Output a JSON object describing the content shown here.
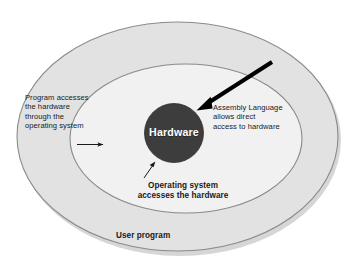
{
  "diagram": {
    "type": "concentric-ellipse-layer-diagram",
    "layers": [
      {
        "id": "outer",
        "name": "user-program-layer",
        "label": "User program",
        "fill": "#e2e2e2",
        "stroke": "#8a8a8a"
      },
      {
        "id": "middle",
        "name": "operating-system-layer",
        "label": "",
        "fill": "#f1f1f1",
        "stroke": "#8a8a8a"
      },
      {
        "id": "core",
        "name": "hardware-core",
        "label": "Hardware",
        "fill": "#3d3d3d",
        "stroke": "#2a2a2a"
      }
    ],
    "annotations": {
      "left": "Program accesses\nthe hardware\nthrough the\noperating system",
      "right": "Assembly Language\nallows direct\naccess to hardware",
      "bottom": "Operating system\naccesses the hardware",
      "outer": "User program",
      "core": "Hardware"
    },
    "arrows": [
      {
        "name": "program-to-os-arrow",
        "from": "left annotation",
        "to": "operating system layer",
        "style": "thin",
        "color": "#1a1a1a"
      },
      {
        "name": "assembly-to-hardware-arrow",
        "from": "Assembly Language annotation",
        "to": "hardware core",
        "style": "thick",
        "color": "#000000"
      },
      {
        "name": "os-to-hardware-arrow",
        "from": "Operating system annotation",
        "to": "hardware core",
        "style": "thin",
        "color": "#1a1a1a"
      }
    ],
    "colors": {
      "background": "#ffffff",
      "outer_fill": "#e2e2e2",
      "middle_fill": "#f1f1f1",
      "core_fill": "#3d3d3d",
      "outline": "#8a8a8a",
      "shadow": "#c9c9c9",
      "text": "#1a1a1a",
      "core_text": "#ffffff"
    }
  }
}
